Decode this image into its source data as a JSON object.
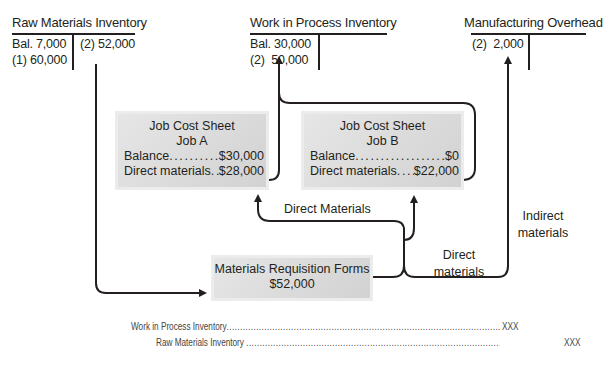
{
  "accounts": {
    "raw_materials": {
      "title": "Raw Materials Inventory",
      "debits": [
        "Bal. 7,000",
        "(1) 60,000"
      ],
      "credits": [
        "(2) 52,000"
      ]
    },
    "work_in_process": {
      "title": "Work in Process Inventory",
      "debits": [
        "Bal. 30,000",
        "(2)  50,000"
      ],
      "credits": []
    },
    "manufacturing_overhead": {
      "title": "Manufacturing Overhead",
      "debits": [
        "(2)  2,000"
      ],
      "credits": []
    }
  },
  "job_sheets": [
    {
      "title": "Job Cost Sheet",
      "job": "Job A",
      "rows": [
        {
          "label": "Balance",
          "value": "$30,000"
        },
        {
          "label": "Direct materials",
          "value": "$28,000"
        }
      ]
    },
    {
      "title": "Job Cost Sheet",
      "job": "Job B",
      "rows": [
        {
          "label": "Balance",
          "value": "$0"
        },
        {
          "label": "Direct materials",
          "value": "$22,000"
        }
      ]
    }
  ],
  "requisition": {
    "title": "Materials Requisition Forms",
    "amount": "$52,000"
  },
  "flow_labels": {
    "direct_materials_top": "Direct Materials",
    "direct_materials_right_1": "Direct",
    "direct_materials_right_2": "materials",
    "indirect_1": "Indirect",
    "indirect_2": "materials"
  },
  "journal_entry": {
    "debit_account": "Work in Process Inventory",
    "credit_account": "Raw Materials Inventory",
    "debit_amount": "XXX",
    "credit_amount": "XXX",
    "leader": "............................................................................................................................"
  },
  "colors": {
    "line": "#231f20",
    "box_fill": "#dcdcdc",
    "text": "#231f20"
  }
}
